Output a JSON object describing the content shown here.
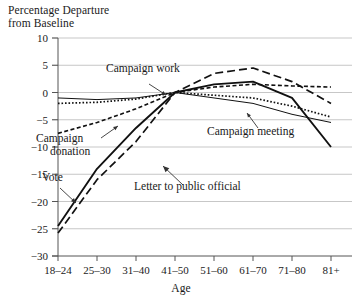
{
  "chart_data": {
    "type": "line",
    "title": "",
    "ylabel": "Percentage Departure\nfrom Baseline",
    "xlabel": "Age",
    "categories": [
      "18–24",
      "25–30",
      "31–40",
      "41–50",
      "51–60",
      "61–70",
      "71–80",
      "81+"
    ],
    "ylim": [
      -30,
      10
    ],
    "yticks": [
      10,
      5,
      0,
      -5,
      -10,
      -15,
      -20,
      -25,
      -30
    ],
    "ytick_labels": [
      "10",
      "5",
      "0",
      "−5",
      "−10",
      "−15",
      "−20",
      "−25",
      "−30"
    ],
    "grid": true,
    "legend": "inline-annotations",
    "series": [
      {
        "name": "Vote",
        "style": "solid-thick",
        "values": [
          -24.5,
          -14.0,
          -6.5,
          0.0,
          1.5,
          2.0,
          -1.0,
          -10.0
        ]
      },
      {
        "name": "Letter to public official",
        "style": "long-dash",
        "values": [
          -25.8,
          -16.0,
          -9.0,
          0.0,
          3.5,
          4.5,
          2.0,
          -2.0
        ]
      },
      {
        "name": "Campaign donation",
        "style": "short-dash",
        "values": [
          -7.5,
          -5.5,
          -3.0,
          0.0,
          1.0,
          1.5,
          1.2,
          1.0
        ]
      },
      {
        "name": "Campaign work",
        "style": "dotted",
        "values": [
          -2.0,
          -1.8,
          -1.2,
          0.0,
          -0.5,
          -1.0,
          -2.5,
          -4.5
        ]
      },
      {
        "name": "Campaign meeting",
        "style": "solid-thin",
        "values": [
          -1.0,
          -1.3,
          -1.0,
          0.0,
          -1.0,
          -2.0,
          -4.0,
          -5.5
        ]
      }
    ],
    "annotations": [
      {
        "label": "Campaign work",
        "x": 106,
        "y": 72
      },
      {
        "label": "Campaign\ndonation",
        "x": 36,
        "y": 142
      },
      {
        "label": "Vote",
        "x": 42,
        "y": 181
      },
      {
        "label": "Letter to public official",
        "x": 134,
        "y": 190
      },
      {
        "label": "Campaign meeting",
        "x": 207,
        "y": 135
      }
    ]
  }
}
